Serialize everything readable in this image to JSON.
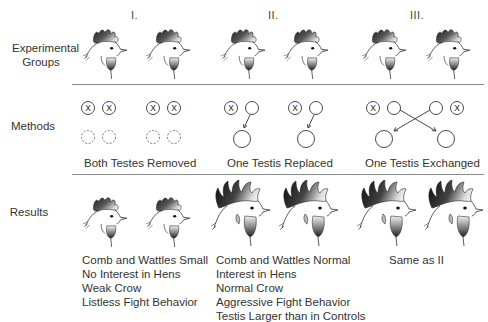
{
  "figure": {
    "groups": [
      {
        "id": "I",
        "label": "I."
      },
      {
        "id": "II",
        "label": "II."
      },
      {
        "id": "III",
        "label": "III."
      }
    ],
    "rows": {
      "experimental_groups": "Experimental\nGroups",
      "experimental_groups_line1": "Experimental",
      "experimental_groups_line2": "Groups",
      "methods": "Methods",
      "results": "Results"
    },
    "methods": {
      "group_I": "Both Testes Removed",
      "group_II": "One Testis Replaced",
      "group_III": "One Testis Exchanged",
      "removed_marker": "X"
    },
    "results": {
      "group_I": [
        "Comb and Wattles Small",
        "No Interest in Hens",
        "Weak Crow",
        "Listless Fight Behavior"
      ],
      "group_II": [
        "Comb and Wattles Normal",
        "Interest in Hens",
        "Normal Crow",
        "Aggressive Fight Behavior",
        "Testis Larger than in Controls"
      ],
      "group_III": [
        "Same as II"
      ]
    },
    "colors": {
      "line": "#8a8a8a",
      "ink": "#333333",
      "comb_dark": "#1e1e1e",
      "background": "#ffffff"
    }
  }
}
